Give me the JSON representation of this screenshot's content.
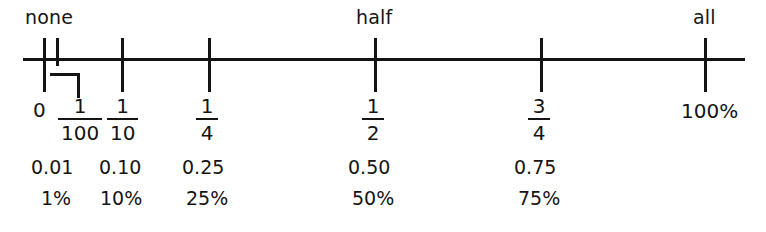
{
  "figure": {
    "type": "number-line",
    "title": "",
    "background_color": "#ffffff",
    "line_color": "#141414"
  },
  "verbal_labels": [
    {
      "text": "none",
      "x": 25,
      "y": 8
    },
    {
      "text": "half",
      "x": 356,
      "y": 8
    },
    {
      "text": "all",
      "x": 693,
      "y": 8
    }
  ],
  "axis": {
    "start_x": 23,
    "end_x": 745,
    "y": 58,
    "thickness": 3
  },
  "ticks": [
    {
      "id": "tick-0",
      "x": 43,
      "top": 38,
      "bottom": 92
    },
    {
      "id": "tick-1-100",
      "x": 56,
      "top": 38,
      "bottom": 66
    },
    {
      "id": "tick-1-10",
      "x": 121,
      "top": 38,
      "bottom": 92
    },
    {
      "id": "tick-1-4",
      "x": 208,
      "top": 38,
      "bottom": 92
    },
    {
      "id": "tick-1-2",
      "x": 374,
      "top": 38,
      "bottom": 92
    },
    {
      "id": "tick-3-4",
      "x": 540,
      "top": 38,
      "bottom": 92
    },
    {
      "id": "tick-100",
      "x": 704,
      "top": 38,
      "bottom": 92
    }
  ],
  "step_connector": {
    "description": "bracket dropping from the 1/100 tick down and across to its label",
    "horizontal_x": 50,
    "horizontal_y": 73,
    "horizontal_width": 30,
    "vertical_x": 77,
    "vertical_y": 73,
    "vertical_height": 25
  },
  "chart_data": {
    "type": "number-line",
    "xlabel": "",
    "ylabel": "",
    "xlim": [
      0,
      1
    ],
    "grid": false,
    "legend": "none",
    "anchor_labels": [
      "none",
      "half",
      "all"
    ],
    "points": [
      {
        "value": 0,
        "fraction": "0",
        "fraction_numerator": "",
        "fraction_denominator": "",
        "decimal": "",
        "percent": "",
        "verbal": "none"
      },
      {
        "value": 0.01,
        "fraction": "1/100",
        "fraction_numerator": "1",
        "fraction_denominator": "100",
        "decimal": "0.01",
        "percent": "1%",
        "verbal": ""
      },
      {
        "value": 0.1,
        "fraction": "1/10",
        "fraction_numerator": "1",
        "fraction_denominator": "10",
        "decimal": "0.10",
        "percent": "10%",
        "verbal": ""
      },
      {
        "value": 0.25,
        "fraction": "1/4",
        "fraction_numerator": "1",
        "fraction_denominator": "4",
        "decimal": "0.25",
        "percent": "25%",
        "verbal": ""
      },
      {
        "value": 0.5,
        "fraction": "1/2",
        "fraction_numerator": "1",
        "fraction_denominator": "2",
        "decimal": "0.50",
        "percent": "50%",
        "verbal": "half"
      },
      {
        "value": 0.75,
        "fraction": "3/4",
        "fraction_numerator": "3",
        "fraction_denominator": "4",
        "decimal": "0.75",
        "percent": "75%",
        "verbal": ""
      },
      {
        "value": 1,
        "fraction": "100%",
        "fraction_numerator": "",
        "fraction_denominator": "",
        "decimal": "",
        "percent": "",
        "verbal": "all"
      }
    ]
  },
  "rows": {
    "zero_label": {
      "text": "0",
      "x": 33,
      "y": 100
    },
    "hundred_label": {
      "text": "100%",
      "x": 681,
      "y": 101
    },
    "fractions": [
      {
        "num": "1",
        "den": "100",
        "x": 58,
        "y": 96
      },
      {
        "num": "1",
        "den": "10",
        "x": 107,
        "y": 96
      },
      {
        "num": "1",
        "den": "4",
        "x": 196,
        "y": 96
      },
      {
        "num": "1",
        "den": "2",
        "x": 362,
        "y": 96
      },
      {
        "num": "3",
        "den": "4",
        "x": 528,
        "y": 96
      }
    ],
    "decimals": [
      {
        "text": "0.01",
        "x": 31,
        "y": 158
      },
      {
        "text": "0.10",
        "x": 99,
        "y": 158
      },
      {
        "text": "0.25",
        "x": 182,
        "y": 158
      },
      {
        "text": "0.50",
        "x": 348,
        "y": 158
      },
      {
        "text": "0.75",
        "x": 514,
        "y": 158
      }
    ],
    "percents": [
      {
        "text": "1%",
        "x": 41,
        "y": 189
      },
      {
        "text": "10%",
        "x": 100,
        "y": 189
      },
      {
        "text": "25%",
        "x": 186,
        "y": 189
      },
      {
        "text": "50%",
        "x": 352,
        "y": 189
      },
      {
        "text": "75%",
        "x": 518,
        "y": 189
      }
    ]
  }
}
